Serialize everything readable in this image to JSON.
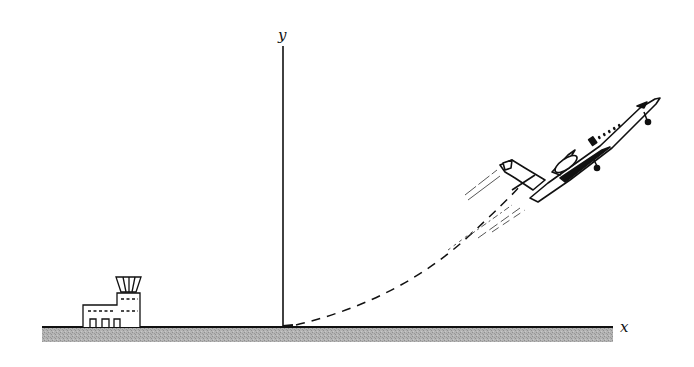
{
  "diagram": {
    "title": "",
    "axes": {
      "x_label": "x",
      "y_label": "y"
    },
    "elements": [
      {
        "name": "ground",
        "type": "hatched-strip"
      },
      {
        "name": "control-tower",
        "type": "building"
      },
      {
        "name": "y-axis",
        "type": "line"
      },
      {
        "name": "x-axis",
        "type": "line"
      },
      {
        "name": "flight-path",
        "type": "dashed-curve"
      },
      {
        "name": "jet-airplane",
        "type": "drawing"
      },
      {
        "name": "exhaust-trail",
        "type": "streak-lines"
      }
    ],
    "colors": {
      "ink": "#111111",
      "ground": "#a8a8a8",
      "background": "#ffffff"
    }
  }
}
